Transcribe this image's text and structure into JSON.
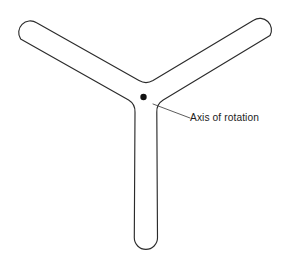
{
  "figure": {
    "kind": "line-diagram",
    "background_color": "#ffffff",
    "stroke_color": "#2b2b2b",
    "width": 283,
    "height": 264,
    "object_name": "three-armed-rotor"
  },
  "annotation": {
    "label": "Axis of rotation",
    "label_x": 190,
    "label_baseline_y": 121,
    "font_size_px": 10.2,
    "text_color": "#1c1c1c",
    "leader": {
      "color": "#4a4a4a",
      "from_x": 153,
      "from_y": 104,
      "to_x": 190,
      "to_y": 118
    }
  },
  "axis_marker": {
    "name": "axis-of-rotation-point",
    "center_x": 143.5,
    "center_y": 97,
    "radius": 3.2,
    "color": "#111111"
  },
  "rotor": {
    "center_x": 146,
    "center_y": 103,
    "arm_half_width": 11.5,
    "arms": [
      {
        "name": "upper-left-arm",
        "tip_x": 28,
        "tip_y": 33,
        "angle_deg": 210
      },
      {
        "name": "upper-right-arm",
        "tip_x": 262,
        "tip_y": 31,
        "angle_deg": 330
      },
      {
        "name": "lower-arm",
        "tip_x": 146,
        "tip_y": 249,
        "angle_deg": 90
      }
    ],
    "outline_path": "M 20.6 38.9 A 11.6 11.6 0 0 1 36.6 22.8 L 139.0 80.6 Q 146.0 84.5 153.0 80.6 L 253.6 20.2 A 11.6 11.6 0 0 1 270.0 35.6 L 163.2 100.1 Q 156.4 104.3 156.8 112.3 L 157.5 237.8 A 11.6 11.6 0 0 1 134.3 237.8 L 135.0 112.3 Q 135.4 104.3 128.6 100.1 Z"
  }
}
